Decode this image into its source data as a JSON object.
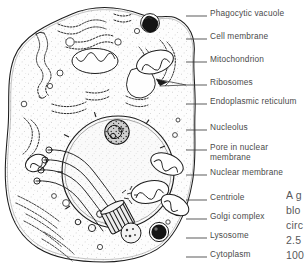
{
  "figure": {
    "style": "hand-drawn line art, black ink on white"
  },
  "labels": [
    {
      "id": "phagocytic-vacuole",
      "text": "Phagocytic vacuole",
      "x": 210,
      "y": 9,
      "line": {
        "x1": 186,
        "y1": 16,
        "x2": 207,
        "y2": 16
      }
    },
    {
      "id": "cell-membrane",
      "text": "Cell membrane",
      "x": 210,
      "y": 32,
      "line": {
        "x1": 186,
        "y1": 39,
        "x2": 207,
        "y2": 39
      }
    },
    {
      "id": "mitochondrion",
      "text": "Mitochondrion",
      "x": 210,
      "y": 55,
      "line": {
        "x1": 186,
        "y1": 62,
        "x2": 207,
        "y2": 62
      }
    },
    {
      "id": "ribosomes",
      "text": "Ribosomes",
      "x": 210,
      "y": 78,
      "line": {
        "x1": 186,
        "y1": 85,
        "x2": 207,
        "y2": 85
      }
    },
    {
      "id": "endoplasmic-reticulum",
      "text": "Endoplasmic reticulum",
      "x": 210,
      "y": 97,
      "line": {
        "x1": 186,
        "y1": 104,
        "x2": 207,
        "y2": 104
      },
      "two_line": true
    },
    {
      "id": "nucleolus",
      "text": "Nucleolus",
      "x": 210,
      "y": 123,
      "line": {
        "x1": 186,
        "y1": 130,
        "x2": 207,
        "y2": 130
      }
    },
    {
      "id": "pore-in-nuclear-membrane",
      "text": "Pore in nuclear membrane",
      "x": 210,
      "y": 143,
      "line": {
        "x1": 186,
        "y1": 150,
        "x2": 207,
        "y2": 150
      },
      "two_line": true
    },
    {
      "id": "nuclear-membrane",
      "text": "Nuclear membrane",
      "x": 210,
      "y": 168,
      "line": {
        "x1": 186,
        "y1": 175,
        "x2": 207,
        "y2": 175
      },
      "two_line": true
    },
    {
      "id": "centriole",
      "text": "Centriole",
      "x": 210,
      "y": 193,
      "line": {
        "x1": 186,
        "y1": 200,
        "x2": 207,
        "y2": 200
      }
    },
    {
      "id": "golgi-complex",
      "text": "Golgi complex",
      "x": 210,
      "y": 212,
      "line": {
        "x1": 186,
        "y1": 219,
        "x2": 207,
        "y2": 219
      }
    },
    {
      "id": "lysosome",
      "text": "Lysosome",
      "x": 210,
      "y": 231,
      "line": {
        "x1": 186,
        "y1": 238,
        "x2": 207,
        "y2": 238
      }
    },
    {
      "id": "cytoplasm",
      "text": "Cytoplasm",
      "x": 210,
      "y": 250,
      "line": {
        "x1": 186,
        "y1": 257,
        "x2": 207,
        "y2": 257
      }
    }
  ],
  "caption": {
    "truncated": true,
    "lines": [
      "A g",
      "blo",
      "circ",
      "2.5",
      "100"
    ]
  },
  "colors": {
    "ink": "#1a1a1a",
    "label_text": "#4a4a4a",
    "caption_text": "#58585a",
    "background": "#ffffff",
    "cytoplasm_fill": "#fdfdfd",
    "nucleus_fill": "#f7f7f7",
    "dark_organelle": "#141414"
  }
}
